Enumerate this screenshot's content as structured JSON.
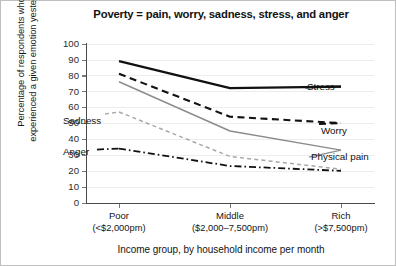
{
  "chart_data": {
    "type": "line",
    "title": "Poverty = pain, worry, sadness, stress, and anger",
    "xlabel": "Income group, by household income per month",
    "ylabel_line1": "Percentage of respondents who",
    "ylabel_line2": "experienced a given emotion yesterday",
    "categories": [
      "Poor",
      "Middle",
      "Rich"
    ],
    "category_sublabels": [
      "(<$2,000pm)",
      "($2,000–7,500pm)",
      "(>$7,500pm)"
    ],
    "ylim": [
      0,
      100
    ],
    "yticks": [
      0,
      10,
      20,
      30,
      40,
      50,
      60,
      70,
      80,
      90,
      100
    ],
    "grid": true,
    "legend_position": "inline-annotations",
    "series": [
      {
        "name": "Stress",
        "values": [
          89,
          72,
          73
        ],
        "color": "#111111",
        "style": "solid",
        "width": 2.2,
        "label_side": "right"
      },
      {
        "name": "Worry",
        "values": [
          81,
          54,
          50
        ],
        "color": "#111111",
        "style": "dashed",
        "width": 2.1,
        "label_side": "right"
      },
      {
        "name": "Physical pain",
        "values": [
          76,
          45,
          33
        ],
        "color": "#8c8c8c",
        "style": "solid",
        "width": 1.5,
        "label_side": "right"
      },
      {
        "name": "Sadness",
        "values": [
          57,
          29,
          21
        ],
        "color": "#a8a8a8",
        "style": "fine-dashed",
        "width": 1.5,
        "label_side": "left"
      },
      {
        "name": "Anger",
        "values": [
          34,
          23,
          20
        ],
        "color": "#111111",
        "style": "dash-dot",
        "width": 1.8,
        "label_side": "left"
      }
    ]
  },
  "annotations": {
    "stress_label": "Stress",
    "worry_label": "Worry",
    "physical_pain_label": "Physical pain",
    "sadness_label": "Sadness",
    "anger_label": "Anger"
  },
  "yticks_text": {
    "t0": "0",
    "t1": "10",
    "t2": "20",
    "t3": "30",
    "t4": "40",
    "t5": "50",
    "t6": "60",
    "t7": "70",
    "t8": "80",
    "t9": "90",
    "t10": "100"
  },
  "xcats_text": {
    "c0": "Poor",
    "c0s": "(<$2,000pm)",
    "c1": "Middle",
    "c1s": "($2,000–7,500pm)",
    "c2": "Rich",
    "c2s": "(>$7,500pm)"
  }
}
